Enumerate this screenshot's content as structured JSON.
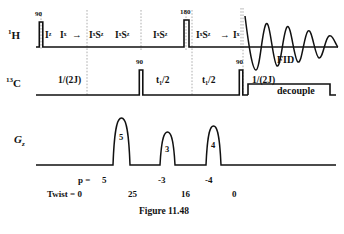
{
  "figure": {
    "caption": "Figure 11.48"
  },
  "channels": {
    "proton": {
      "label_sup": "1",
      "label_main": "H"
    },
    "carbon": {
      "label_sup": "13",
      "label_main": "C"
    },
    "gradient": {
      "label_main": "G",
      "label_sub": "z"
    }
  },
  "proton_row": {
    "pulses": [
      {
        "flip": "90",
        "x": 41,
        "width": 3.5
      },
      {
        "flip": "180",
        "x": 186,
        "width": 5
      }
    ],
    "operators": [
      {
        "text": "I",
        "sup": "z",
        "x": 49
      },
      {
        "text": "I",
        "sup": "y",
        "x": 66
      },
      {
        "text": "I",
        "sup": "x",
        "sup2": "S",
        "x": 95,
        "display": "I S"
      },
      {
        "text": "I S",
        "sup": "z",
        "x": 133
      },
      {
        "text": "I S",
        "sup": "z",
        "x": 173
      },
      {
        "text": "I S",
        "sup": "z",
        "x": 211
      },
      {
        "text": "I",
        "sup": "",
        "x": 248
      }
    ],
    "op_labels": [
      "Iᶻ",
      "Iˣ",
      "IˣSᶻ",
      "IˣSᶻ",
      "IˣSᶻ",
      "IˣSᶻ",
      "Iˣ"
    ],
    "arrows": [
      "→",
      "→"
    ],
    "fid_label": "FID"
  },
  "carbon_row": {
    "pulses": [
      {
        "flip": "90",
        "x": 141,
        "width": 3.5
      },
      {
        "flip": "90",
        "x": 241,
        "width": 3.5
      }
    ],
    "delays": [
      {
        "label": "1/(2J)",
        "x": 76
      },
      {
        "label": "t₁/2",
        "x": 161
      },
      {
        "label": "t₁/2",
        "x": 206
      },
      {
        "label": "1/(2J)",
        "x": 262
      }
    ],
    "decouple_label": "decouple"
  },
  "gradient_row": {
    "pulses": [
      {
        "amplitude_label": "5",
        "x": 121,
        "height": 44,
        "width": 17
      },
      {
        "amplitude_label": "3",
        "x": 168,
        "height": 30,
        "width": 15
      },
      {
        "amplitude_label": "4",
        "x": 214,
        "height": 36,
        "width": 15
      }
    ]
  },
  "annotations": {
    "coherence_label": "p =",
    "coherence_values": [
      {
        "value": "5",
        "x": 102
      },
      {
        "value": "-3",
        "x": 160
      },
      {
        "value": "-4",
        "x": 207
      }
    ],
    "twist_label": "Twist = 0",
    "twist_values": [
      {
        "value": "25",
        "x": 130
      },
      {
        "value": "16",
        "x": 183
      },
      {
        "value": "0",
        "x": 233
      }
    ]
  },
  "colors": {
    "line": "#111111",
    "dotted": "#9a9a9a",
    "background": "#ffffff"
  }
}
